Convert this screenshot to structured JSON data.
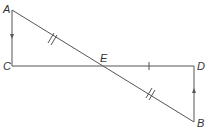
{
  "diagram": {
    "type": "geometry",
    "colors": {
      "line": "#555555",
      "label": "#333333"
    },
    "points": {
      "A": {
        "label": "A",
        "x": 12,
        "y": 10
      },
      "B": {
        "label": "B",
        "x": 194,
        "y": 122
      },
      "C": {
        "label": "C",
        "x": 12,
        "y": 66
      },
      "D": {
        "label": "D",
        "x": 194,
        "y": 66
      },
      "E": {
        "label": "E",
        "x": 104,
        "y": 66
      }
    },
    "segments": [
      {
        "from": "A",
        "to": "C",
        "marking": "arrow-down"
      },
      {
        "from": "C",
        "to": "D",
        "marking": "none"
      },
      {
        "from": "A",
        "to": "B",
        "marking": "none"
      },
      {
        "from": "D",
        "to": "B",
        "marking": "arrow-up"
      },
      {
        "from": "A",
        "to": "E",
        "marking": "double-tick"
      },
      {
        "from": "E",
        "to": "B",
        "marking": "double-tick"
      },
      {
        "from": "E",
        "to": "D",
        "marking": "single-tick"
      }
    ]
  }
}
